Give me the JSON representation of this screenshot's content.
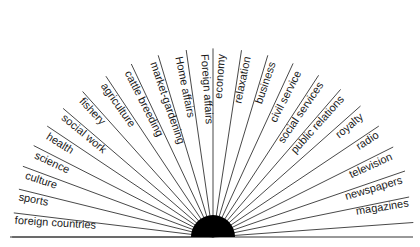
{
  "diagram": {
    "center": {
      "x": 213,
      "y": 237
    },
    "disc_radius": 22,
    "ray_length": 205,
    "baseline": {
      "x1": 10,
      "x2": 413,
      "y": 237
    },
    "colors": {
      "ink": "#1a1a1a",
      "line": "#333333",
      "background": "#ffffff"
    },
    "labels": [
      {
        "text": "foreign countries",
        "angle": 176.5,
        "side": "left"
      },
      {
        "text": "sports",
        "angle": 169,
        "side": "left"
      },
      {
        "text": "culture",
        "angle": 162,
        "side": "left"
      },
      {
        "text": "science",
        "angle": 155,
        "side": "left"
      },
      {
        "text": "health",
        "angle": 148,
        "side": "left"
      },
      {
        "text": "social work",
        "angle": 140.5,
        "side": "left"
      },
      {
        "text": "fishery",
        "angle": 133,
        "side": "left"
      },
      {
        "text": "agriculture",
        "angle": 125,
        "side": "left"
      },
      {
        "text": "cattle breeding",
        "angle": 117,
        "side": "left"
      },
      {
        "text": "market-gardening",
        "angle": 109,
        "side": "left"
      },
      {
        "text": "Home affairs",
        "angle": 101.5,
        "side": "left"
      },
      {
        "text": "Foreign affairs",
        "angle": 94,
        "side": "left"
      },
      {
        "text": "economy",
        "angle": 86,
        "side": "right"
      },
      {
        "text": "relaxation",
        "angle": 78.5,
        "side": "right"
      },
      {
        "text": "business",
        "angle": 71,
        "side": "right"
      },
      {
        "text": "civil service",
        "angle": 63,
        "side": "right"
      },
      {
        "text": "social services",
        "angle": 55.5,
        "side": "right"
      },
      {
        "text": "public relations",
        "angle": 48,
        "side": "right"
      },
      {
        "text": "royalty",
        "angle": 40,
        "side": "right"
      },
      {
        "text": "radio",
        "angle": 32.5,
        "side": "right"
      },
      {
        "text": "television",
        "angle": 24.5,
        "side": "right"
      },
      {
        "text": "newspapers",
        "angle": 16.5,
        "side": "right"
      },
      {
        "text": "magazines",
        "angle": 9,
        "side": "right"
      }
    ],
    "rays": [
      180,
      172.5,
      165,
      158,
      151,
      144,
      137,
      129.5,
      121.5,
      113.5,
      105.5,
      97.5,
      90,
      82,
      74.5,
      67,
      59,
      51.5,
      44,
      36,
      28.5,
      20.5,
      12.5,
      4.5
    ]
  }
}
